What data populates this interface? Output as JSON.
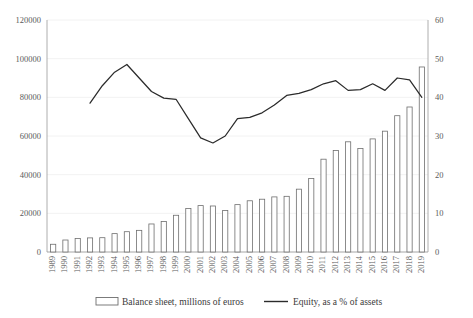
{
  "chart_data": {
    "type": "bar",
    "title": "",
    "subtitle": "",
    "xlabel": "",
    "ylabel": "",
    "y2label": "",
    "grid": true,
    "legend_position": "bottom",
    "categories": [
      "1989",
      "1990",
      "1991",
      "1992",
      "1993",
      "1994",
      "1995",
      "1996",
      "1997",
      "1998",
      "1999",
      "2000",
      "2001",
      "2002",
      "2003",
      "2004",
      "2005",
      "2006",
      "2007",
      "2008",
      "2009",
      "2010",
      "2011",
      "2012",
      "2013",
      "2014",
      "2015",
      "2016",
      "2017",
      "2018",
      "2019"
    ],
    "ylim": [
      0,
      120000
    ],
    "yticks": [
      0,
      20000,
      40000,
      60000,
      80000,
      100000,
      120000
    ],
    "ytick_labels": [
      "0",
      "20000",
      "40000",
      "60000",
      "80000",
      "100000",
      "120000"
    ],
    "y2lim": [
      0,
      60
    ],
    "y2ticks": [
      0,
      10,
      20,
      30,
      40,
      50,
      60
    ],
    "y2tick_labels": [
      "0",
      "10",
      "20",
      "30",
      "40",
      "50",
      "60"
    ],
    "series": [
      {
        "name": "Balance sheet, millions of euros",
        "type": "bar",
        "axis": "left",
        "color": "#ffffff",
        "edge_color": "#6e6e6e",
        "values": [
          4000,
          6200,
          7000,
          7300,
          7400,
          9500,
          10500,
          11200,
          14500,
          15800,
          19000,
          22500,
          24000,
          23800,
          21500,
          24500,
          26500,
          27300,
          28500,
          28800,
          32500,
          38000,
          48000,
          52500,
          57000,
          53500,
          58500,
          62500,
          70500,
          75000,
          95700
        ]
      },
      {
        "name": "Equity, as a % of assets",
        "type": "line",
        "axis": "right",
        "color": "#2b2b2b",
        "x_start_index": 3,
        "values": [
          null,
          null,
          null,
          38.5,
          43.0,
          46.5,
          48.5,
          45.0,
          41.5,
          39.8,
          39.5,
          34.5,
          29.5,
          28.2,
          30.0,
          34.5,
          34.8,
          36.0,
          38.0,
          40.5,
          41.0,
          42.0,
          43.5,
          44.3,
          41.8,
          42.0,
          43.5,
          41.8,
          45.0,
          44.5,
          40.0
        ]
      }
    ]
  },
  "legend": {
    "items": [
      {
        "label": "Balance sheet, millions of euros",
        "marker": "bar-swatch"
      },
      {
        "label": "Equity, as a % of assets",
        "marker": "line-swatch"
      }
    ]
  }
}
